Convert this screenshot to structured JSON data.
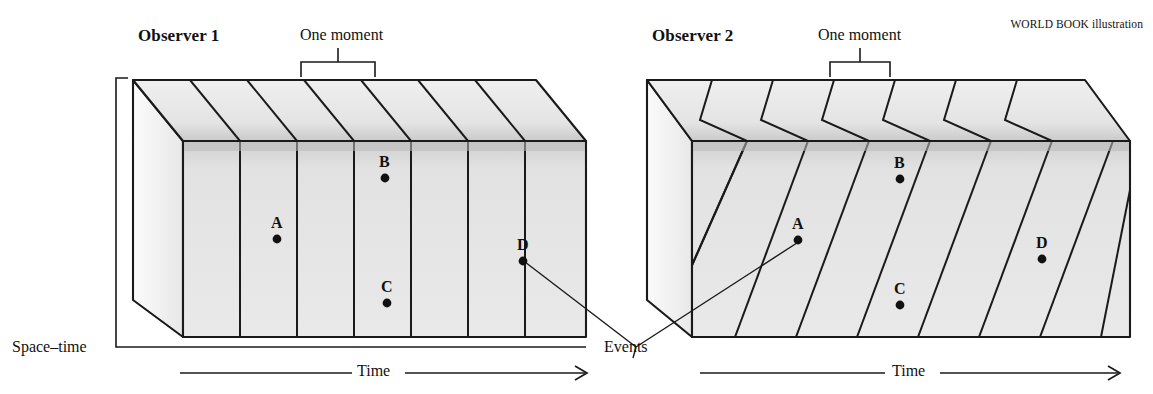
{
  "credit": "WORLD BOOK illustration",
  "panels": [
    {
      "id": "observer-1",
      "title": "Observer 1",
      "moment_label": "One moment",
      "axis_label": "Time",
      "slice_style": "vertical",
      "events": [
        {
          "label": "A",
          "x": 277,
          "y": 239
        },
        {
          "label": "B",
          "x": 385,
          "y": 178
        },
        {
          "label": "C",
          "x": 387,
          "y": 303
        },
        {
          "label": "D",
          "x": 523,
          "y": 261
        }
      ]
    },
    {
      "id": "observer-2",
      "title": "Observer 2",
      "moment_label": "One moment",
      "axis_label": "Time",
      "slice_style": "slanted",
      "events": [
        {
          "label": "A",
          "x": 798,
          "y": 240
        },
        {
          "label": "B",
          "x": 900,
          "y": 179
        },
        {
          "label": "C",
          "x": 900,
          "y": 305
        },
        {
          "label": "D",
          "x": 1042,
          "y": 259
        }
      ]
    }
  ],
  "annotations": {
    "spacetime_label": "Space–time",
    "events_label": "Events"
  },
  "colors": {
    "ink": "#1a1a1a",
    "front_face": "#e3e3e3",
    "top_face": "#ebebeb",
    "side_face": "#f2f2f2",
    "shadow_band": "#c9c9c9",
    "background": "#ffffff"
  }
}
